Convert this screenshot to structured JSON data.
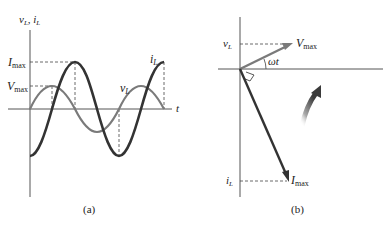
{
  "figure": {
    "panel_a": {
      "caption": "(a)",
      "y_axis_label": {
        "v": "v",
        "v_sub": "L",
        "sep": ", ",
        "i": "i",
        "i_sub": "L"
      },
      "x_axis_label": "t",
      "level_labels": {
        "imax": {
          "main": "I",
          "sub": "max"
        },
        "vmax": {
          "main": "V",
          "sub": "max"
        }
      },
      "curve_labels": {
        "i_L": {
          "main": "i",
          "sub": "L"
        },
        "v_L": {
          "main": "v",
          "sub": "L"
        }
      },
      "colors": {
        "v_L": "#7a7a7a",
        "i_L": "#333333",
        "axis": "#555555"
      }
    },
    "panel_b": {
      "caption": "(b)",
      "phasor_labels": {
        "vmax": {
          "main": "V",
          "sub": "max"
        },
        "imax": {
          "main": "I",
          "sub": "max"
        }
      },
      "projection_labels": {
        "v_L": {
          "main": "v",
          "sub": "L"
        },
        "i_L": {
          "main": "i",
          "sub": "L"
        }
      },
      "angle_label": "ωt",
      "rotation_arrow": "counterclockwise-rotation",
      "colors": {
        "vmax_phasor": "#7a7a7a",
        "imax_phasor": "#333333",
        "rotation_arrow": "#444444"
      }
    }
  }
}
